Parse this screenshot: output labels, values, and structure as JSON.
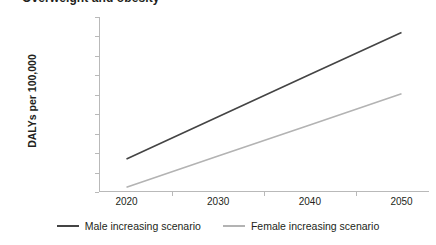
{
  "figure": {
    "title": "Overweight and obesity",
    "title_clipped": true
  },
  "chart_data": {
    "type": "line",
    "title": "Overweight and obesity",
    "xlabel": "",
    "ylabel": "DALYs per 100,000",
    "x": [
      2020,
      2030,
      2040,
      2050
    ],
    "xlim": [
      2017,
      2053
    ],
    "ylim": [
      3000,
      12000
    ],
    "ytick_labels": [
      "12,000",
      "11,000",
      "10,000",
      "9,000",
      "8,000",
      "7,000",
      "6,000",
      "5,000",
      "4,000",
      "3,000"
    ],
    "ytick_values": [
      12000,
      11000,
      10000,
      9000,
      8000,
      7000,
      6000,
      5000,
      4000,
      3000
    ],
    "xtick_labels": [
      "2020",
      "2030",
      "2040",
      "2050"
    ],
    "grid": false,
    "legend_position": "bottom",
    "series": [
      {
        "name": "Male increasing scenario",
        "color": "#444444",
        "values": [
          4700,
          6870,
          9040,
          11200
        ]
      },
      {
        "name": "Female increasing scenario",
        "color": "#b3b3b3",
        "values": [
          3250,
          4850,
          6450,
          8050
        ]
      }
    ]
  },
  "axes": {
    "y_title": "DALYs per 100,000"
  },
  "colors": {
    "male_series": "#444444",
    "female_series": "#b3b3b3",
    "axis": "#b9b9b9",
    "text": "#231f20",
    "background": "#ffffff"
  }
}
